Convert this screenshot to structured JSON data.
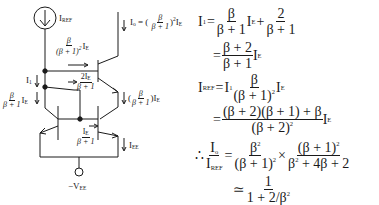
{
  "circuit": {
    "source_label": {
      "main": "I",
      "sub": "REF"
    },
    "output_current": {
      "lhs_main": "I",
      "lhs_sub": "o",
      "eq": "= (",
      "num": "β",
      "den": "β + 1",
      "close": ")",
      "pow": "2",
      "tail_main": "I",
      "tail_sub": "E"
    },
    "base_current_top": {
      "num": "β",
      "den_open": "(β + 1)",
      "den_pow": "2",
      "tail_main": "I",
      "tail_sub": "E"
    },
    "i1_label": {
      "main": "I",
      "sub": "1"
    },
    "two_ie": {
      "num_main": "2I",
      "num_sub": "E",
      "den": "β + 1"
    },
    "left_branch": {
      "num": "β",
      "den": "β + 1",
      "tail_main": "I",
      "tail_sub": "E"
    },
    "right_branch": {
      "open": "(",
      "num": "β",
      "den": "β + 1",
      "close": ")",
      "tail_main": "I",
      "tail_sub": "E"
    },
    "bottom_base": {
      "num_main": "I",
      "num_sub": "E",
      "den": "β + 1"
    },
    "iee_label": {
      "main": "I",
      "sub": "EE"
    },
    "supply_label": {
      "main": "−V",
      "sub": "EE"
    }
  },
  "equations": {
    "line1": {
      "lhs_main": "I",
      "lhs_sub": "1",
      "eq": "=",
      "f1_num": "β",
      "f1_den": "β + 1",
      "ie_main": "I",
      "ie_sub": "E",
      "plus": "+",
      "f2_num": "2",
      "f2_den": "β + 1"
    },
    "line2": {
      "eq": "=",
      "num": "β + 2",
      "den": "β + 1",
      "ie_main": "I",
      "ie_sub": "E"
    },
    "line3": {
      "lhs_main": "I",
      "lhs_sub": "REF",
      "eq": "=",
      "i1_main": "I",
      "i1_sub": "1",
      "num": "β",
      "den_base": "(β + 1)",
      "den_pow": "2",
      "ie_main": "I",
      "ie_sub": "E"
    },
    "line4": {
      "eq": "=",
      "num": "(β + 2)(β + 1) + β",
      "den_base": "(β + 2)",
      "den_pow": "2",
      "ie_main": "I",
      "ie_sub": "E"
    },
    "line5": {
      "therefore": "∴",
      "lf_num_main": "I",
      "lf_num_sub": "o",
      "lf_den_main": "I",
      "lf_den_sub": "REF",
      "eq": "=",
      "f1_num_base": "β",
      "f1_num_pow": "2",
      "f1_den_base": "(β + 1)",
      "f1_den_pow": "2",
      "times": "×",
      "f2_num_base": "(β + 1)",
      "f2_num_pow": "2",
      "f2_den_a": "β",
      "f2_den_a_pow": "2",
      "f2_den_b": " + 4β + 2"
    },
    "line6": {
      "approx": "≃",
      "num": "1",
      "den_a": "1 + 2/β",
      "den_pow": "2"
    }
  }
}
